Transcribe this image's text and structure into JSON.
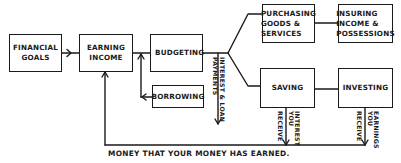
{
  "diagram": {
    "type": "flowchart",
    "nodes": {
      "financial_goals": {
        "label": "FINANCIAL\nGOALS"
      },
      "earning_income": {
        "label": "EARNING\nINCOME"
      },
      "budgeting": {
        "label": "BUDGETING"
      },
      "borrowing": {
        "label": "BORROWING"
      },
      "purchasing": {
        "label": "PURCHASING\nGOODS &\nSERVICES"
      },
      "insuring": {
        "label": "INSURING\nINCOME &\nPOSSESSIONS"
      },
      "saving": {
        "label": "SAVING"
      },
      "investing": {
        "label": "INVESTING"
      }
    },
    "edge_labels": {
      "interest_loan_line1": "INTEREST & LOAN",
      "interest_loan_line2": "PAYMENTS",
      "saving_line1": "INTEREST",
      "saving_line2": "YOU",
      "saving_line3": "RECEIVE",
      "investing_line1": "EARNINGS",
      "investing_line2": "YOU",
      "investing_line3": "RECEIVE"
    },
    "bottom_label": "MONEY THAT YOUR MONEY HAS EARNED.",
    "edges": [
      {
        "from": "financial_goals",
        "to": "earning_income"
      },
      {
        "from": "earning_income",
        "to": "budgeting"
      },
      {
        "from": "borrowing",
        "to": "earning_income-budgeting link"
      },
      {
        "from": "budgeting",
        "to": "purchasing"
      },
      {
        "from": "budgeting",
        "to": "saving"
      },
      {
        "from": "budgeting",
        "to": "interest & loan payments",
        "label": "INTEREST & LOAN PAYMENTS"
      },
      {
        "from": "purchasing",
        "to": "insuring"
      },
      {
        "from": "saving",
        "to": "investing"
      },
      {
        "from": "saving",
        "to": "earning_income",
        "label": "INTEREST YOU RECEIVE"
      },
      {
        "from": "investing",
        "to": "earning_income",
        "label": "EARNINGS YOU RECEIVE"
      }
    ]
  }
}
